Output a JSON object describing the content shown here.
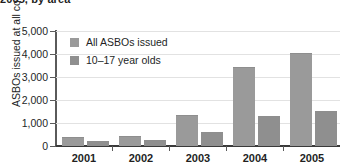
{
  "title_clipped": "2005, by area",
  "chart_data": {
    "type": "bar",
    "title": "2005, by area",
    "xlabel": "",
    "ylabel": "ASBOs issued at all courts",
    "categories": [
      "2001",
      "2002",
      "2003",
      "2004",
      "2005"
    ],
    "series": [
      {
        "name": "All ASBOs issued",
        "values": [
          330,
          390,
          1300,
          3430,
          4040
        ],
        "color": "#9a9a9a"
      },
      {
        "name": "10–17 year olds",
        "values": [
          170,
          220,
          580,
          1290,
          1500
        ],
        "color": "#8f8f8f"
      }
    ],
    "ylim": [
      0,
      5000
    ],
    "ytick_labels": [
      "0",
      "1,000",
      "2,000",
      "3,000",
      "4,000",
      "5,000"
    ],
    "ytick_values": [
      0,
      1000,
      2000,
      3000,
      4000,
      5000
    ],
    "grid": true,
    "legend_position": "top-left"
  },
  "axis": {
    "y_title": "ASBOs issued at all courts",
    "y_ticks": [
      "5,000",
      "4,000",
      "3,000",
      "2,000",
      "1,000",
      "0"
    ],
    "x_ticks": [
      "2001",
      "2002",
      "2003",
      "2004",
      "2005"
    ]
  },
  "legend": {
    "items": [
      {
        "label": "All ASBOs issued"
      },
      {
        "label": "10–17 year olds"
      }
    ]
  }
}
